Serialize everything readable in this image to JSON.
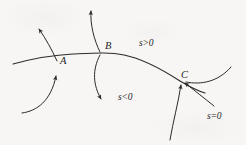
{
  "figure": {
    "type": "mathematical-diagram",
    "background_color": "#f7f6f4",
    "ink_color": "#2b2b2b",
    "width": 246,
    "height": 145,
    "point_labels": [
      {
        "id": "A",
        "text": "A",
        "x": 60,
        "y": 62
      },
      {
        "id": "B",
        "text": "B",
        "x": 105,
        "y": 48
      },
      {
        "id": "C",
        "text": "C",
        "x": 181,
        "y": 77
      }
    ],
    "region_labels": [
      {
        "id": "s-positive",
        "text": "s>0",
        "x": 139,
        "y": 39
      },
      {
        "id": "s-negative",
        "text": "s<0",
        "x": 118,
        "y": 93
      },
      {
        "id": "s-zero",
        "text": "s=0",
        "x": 207,
        "y": 112
      }
    ],
    "main_curve": {
      "name": "principal-curve",
      "path": "M 13 64 C 35 58, 52 55, 73 54 C 95 53, 110 52, 124 55 C 144 59, 163 70, 180 81 C 190 87, 198 91, 205 93"
    },
    "transversal_curves": [
      {
        "name": "arrow-up-at-A",
        "path": "M 57 61 C 52 50, 46 39, 38 28",
        "arrow_at": "end",
        "direction": "up-left"
      },
      {
        "name": "arrow-into-A-from-below",
        "path": "M 22 113 C 36 110, 50 100, 56 78",
        "arrow_at": "end",
        "direction": "up"
      },
      {
        "name": "arrow-up-at-B",
        "path": "M 99 52 C 93 40, 90 25, 91 10",
        "arrow_at": "end",
        "direction": "up"
      },
      {
        "name": "arrow-down-from-B",
        "path": "M 99 56 C 92 70, 93 84, 101 100",
        "arrow_at": "end",
        "direction": "down"
      },
      {
        "name": "arrow-into-C-from-below",
        "path": "M 170 139 C 173 122, 178 105, 181 86",
        "arrow_at": "end",
        "direction": "up"
      },
      {
        "name": "arrow-into-C-from-lower-right",
        "path": "M 213 105 C 203 97, 193 89, 184 82",
        "arrow_at": "end",
        "direction": "up-left"
      },
      {
        "name": "right-branch-curve",
        "path": "M 186 82 C 200 84, 217 82, 231 68",
        "arrow_at": "none",
        "direction": "none"
      }
    ]
  }
}
